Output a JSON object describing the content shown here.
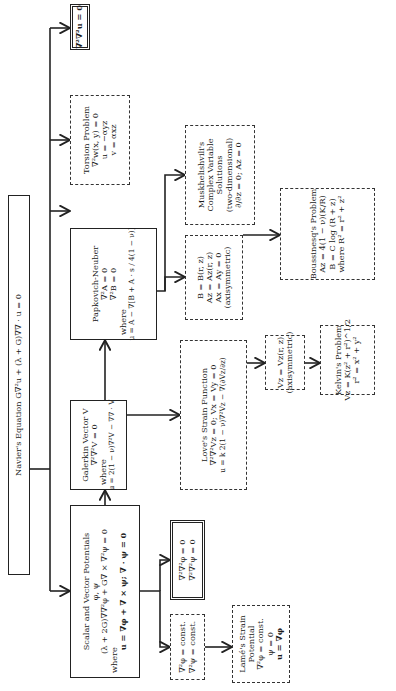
{
  "diagram": {
    "boxes": {
      "navier": {
        "lines": [
          "Navier's Equation G∇²u + (λ + G)∇∇ · u = 0"
        ]
      },
      "scalar_vector": {
        "lines": [
          "Scalar and Vector Potentials",
          "φ, ψ",
          "(λ + 2G)∇∇²φ + G∇ × ∇²ψ = 0",
          "where",
          "u = ∇φ + ∇ × ψ; ∇ · ψ = 0"
        ]
      },
      "galerkin": {
        "lines": [
          "Galerkin Vector V",
          "∇²∇²V = 0",
          "where",
          "u = 2(1 − ν)∇²V − ∇∇ · V"
        ]
      },
      "papkovich": {
        "lines": [
          "Papkovich-Neuber",
          "∇²A = 0",
          "∇²B = 0",
          "where",
          "u = A − ∇[B + A · s / 4(1 − ν)]"
        ]
      },
      "torsion": {
        "lines": [
          "Torsion Problem",
          "∇²w(x, y) = 0",
          "u = −αyz",
          "v = αxz"
        ]
      },
      "biharmonic_u": {
        "lines": [
          "∇²∇²u = 0"
        ]
      },
      "biharmonic_phi_psi": {
        "lines": [
          "∇²∇²φ = 0",
          "∇²∇²ψ = 0"
        ]
      },
      "laplacian_const": {
        "lines": [
          "∇²φ = const.",
          "∇²ψ = const."
        ]
      },
      "lame": {
        "lines": [
          "Lamé's Strain",
          "Potential",
          "∇²φ = const.",
          "ψ = 0",
          "u = ∇φ"
        ]
      },
      "love": {
        "lines": [
          "Love's Strain Function",
          "∇²∇²Vz = 0;   Vx = Vy = 0",
          "u = k 2(1 − ν)∇²Vz − ∇(∂Vz/∂z)"
        ]
      },
      "papkovich_axisym": {
        "lines": [
          "B = B(r, z)",
          "Az = Az(r, z)",
          "Ax = Ay = 0",
          "(axisymmetric)"
        ]
      },
      "muskhelishvili": {
        "lines": [
          "Muskhelishvili's",
          "Complex Variable",
          "Solutions",
          "(two-dimensional)",
          "∂/∂z = 0;   Az = 0"
        ]
      },
      "vz_axisym": {
        "lines": [
          "Vz = Vz(r, z)",
          "(axisymmetric)"
        ]
      },
      "kelvin": {
        "lines": [
          "Kelvin's Problem",
          "Vz = K(z² + r²)^1/2",
          "r² = x² + y²"
        ]
      },
      "boussinesq": {
        "lines": [
          "Boussinesq's Problem",
          "Az = 4(1 − ν)(K/R)",
          "B = C log (R + z)",
          "where R² = r² + z²"
        ]
      }
    },
    "colors": {
      "ink": "#222222",
      "background": "#ffffff"
    }
  }
}
